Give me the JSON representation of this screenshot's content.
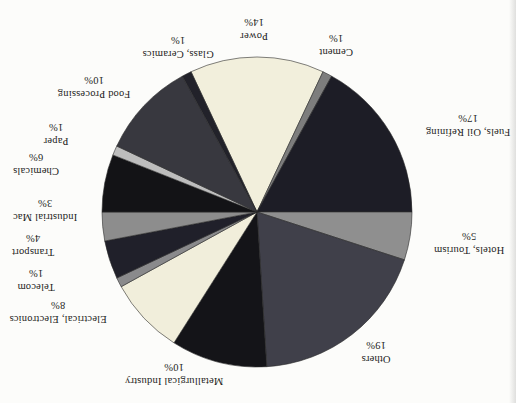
{
  "chart_data": {
    "type": "pie",
    "title": "",
    "orientation_note": "entire chart is rotated 180 degrees; all labels appear upside down",
    "direction": "clockwise",
    "start_angle_deg": -25.2,
    "center_px": [
      257,
      212
    ],
    "radius_px": 155,
    "slice_stroke": "#2b2b2b",
    "categories": [
      "Power",
      "Cement",
      "Fuels, Oil Refining",
      "Hotels, Tourism",
      "Others",
      "Metallurgical Industry",
      "Electrical, Electronics",
      "Telecom",
      "Transport",
      "Industrial Mac",
      "Chemicals",
      "Paper",
      "Food Processing",
      "Glass, Ceramics"
    ],
    "values": [
      14,
      1,
      17,
      5,
      19,
      10,
      8,
      1,
      4,
      3,
      6,
      1,
      10,
      1
    ],
    "slices": [
      {
        "id": "power",
        "label": "Power",
        "pct": 14,
        "pct_label": "14%",
        "color": "#f2efdc",
        "label_x": 254,
        "label_y": 29
      },
      {
        "id": "cement",
        "label": "Cement",
        "pct": 1,
        "pct_label": "1%",
        "color": "#7d7d7d",
        "label_x": 336,
        "label_y": 45
      },
      {
        "id": "fuels-oil-refining",
        "label": "Fuels, Oil Refining",
        "pct": 17,
        "pct_label": "17%",
        "color": "#1d1d26",
        "label_x": 468,
        "label_y": 125
      },
      {
        "id": "hotels-tourism",
        "label": "Hotels, Tourism",
        "pct": 5,
        "pct_label": "5%",
        "color": "#8f8f8f",
        "label_x": 469,
        "label_y": 243
      },
      {
        "id": "others",
        "label": "Others",
        "pct": 19,
        "pct_label": "19%",
        "color": "#40404a",
        "label_x": 376,
        "label_y": 352
      },
      {
        "id": "metallurgical-industry",
        "label": "Metallurgical Industry",
        "pct": 10,
        "pct_label": "10%",
        "color": "#141418",
        "label_x": 174,
        "label_y": 374
      },
      {
        "id": "electrical-electronics",
        "label": "Electrical, Electronics",
        "pct": 8,
        "pct_label": "8%",
        "color": "#f1eedb",
        "label_x": 58,
        "label_y": 312
      },
      {
        "id": "telecom",
        "label": "Telecom",
        "pct": 1,
        "pct_label": "1%",
        "color": "#8a8a8c",
        "label_x": 36,
        "label_y": 280
      },
      {
        "id": "transport",
        "label": "Transport",
        "pct": 4,
        "pct_label": "4%",
        "color": "#20202a",
        "label_x": 33,
        "label_y": 245
      },
      {
        "id": "industrial-mac",
        "label": "Industrial Mac",
        "pct": 3,
        "pct_label": "3%",
        "color": "#8d8d8d",
        "label_x": 45,
        "label_y": 210
      },
      {
        "id": "chemicals",
        "label": "Chemicals",
        "pct": 6,
        "pct_label": "6%",
        "color": "#131316",
        "label_x": 36,
        "label_y": 164
      },
      {
        "id": "paper",
        "label": "Paper",
        "pct": 1,
        "pct_label": "1%",
        "color": "#bdbdbd",
        "label_x": 56,
        "label_y": 134
      },
      {
        "id": "food-processing",
        "label": "Food Processing",
        "pct": 10,
        "pct_label": "10%",
        "color": "#38383f",
        "label_x": 94,
        "label_y": 87
      },
      {
        "id": "glass-ceramics",
        "label": "Glass, Ceramics",
        "pct": 1,
        "pct_label": "1%",
        "color": "#22222a",
        "label_x": 178,
        "label_y": 47
      }
    ]
  }
}
